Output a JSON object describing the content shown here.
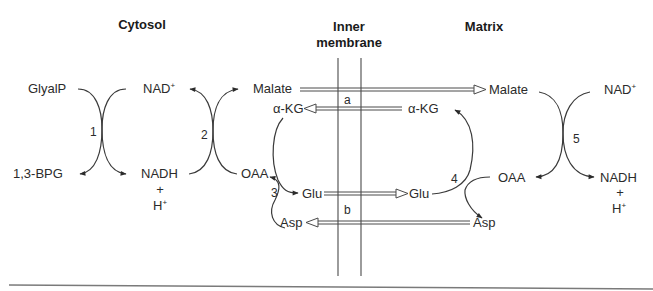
{
  "headers": {
    "cytosol": "Cytosol",
    "membrane_line1": "Inner",
    "membrane_line2": "membrane",
    "matrix": "Matrix"
  },
  "cytosol": {
    "glyalp": "GlyalP",
    "bpg": "1,3-BPG",
    "nad_plus": "NAD",
    "nad_plus_sup": "+",
    "nadh": "NADH",
    "plus": "+",
    "h": "H",
    "h_sup": "+",
    "malate": "Malate",
    "akg": "α-KG",
    "oaa": "OAA",
    "glu": "Glu",
    "asp": "Asp"
  },
  "matrix": {
    "malate": "Malate",
    "akg": "α-KG",
    "glu": "Glu",
    "asp": "Asp",
    "oaa": "OAA",
    "nad_plus": "NAD",
    "nad_plus_sup": "+",
    "nadh": "NADH",
    "plus": "+",
    "h": "H",
    "h_sup": "+"
  },
  "reactions": {
    "r1": "1",
    "r2": "2",
    "r3": "3",
    "r4": "4",
    "r5": "5"
  },
  "transporters": {
    "a": "a",
    "b": "b"
  }
}
